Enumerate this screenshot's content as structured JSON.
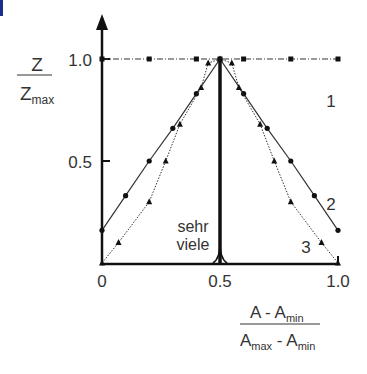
{
  "chart_data": {
    "type": "line",
    "title": "",
    "ylabel": {
      "numerator": "Z",
      "denominator": "Z",
      "denominator_sub": "max"
    },
    "xlabel": {
      "numerator": "A - A",
      "numerator_sub": "min",
      "denominator_a": "A",
      "denominator_a_sub": "max",
      "denominator_b": " - A",
      "denominator_b_sub": "min"
    },
    "xlim": [
      0,
      1.0
    ],
    "ylim": [
      0,
      1.0
    ],
    "x_ticks": [
      "0",
      "0.5",
      "1.0"
    ],
    "y_ticks": [
      "0.5",
      "1.0"
    ],
    "grid": false,
    "annotation": {
      "line1": "sehr",
      "line2": "viele"
    },
    "series": [
      {
        "name": "1",
        "style": "dash-dot, square markers",
        "x": [
          0,
          0.2,
          0.4,
          0.5,
          0.6,
          0.8,
          1.0
        ],
        "y": [
          1.0,
          1.0,
          1.0,
          1.0,
          1.0,
          1.0,
          1.0
        ]
      },
      {
        "name": "2",
        "style": "solid, circle markers",
        "x": [
          0,
          0.1,
          0.2,
          0.3,
          0.4,
          0.5,
          0.6,
          0.7,
          0.8,
          0.9,
          1.0
        ],
        "y": [
          0.16,
          0.33,
          0.5,
          0.66,
          0.83,
          1.0,
          0.83,
          0.66,
          0.5,
          0.33,
          0.16
        ]
      },
      {
        "name": "3",
        "style": "dotted, triangle markers",
        "x": [
          0,
          0.07,
          0.2,
          0.27,
          0.33,
          0.42,
          0.45,
          0.5,
          0.55,
          0.58,
          0.67,
          0.73,
          0.8,
          0.93,
          1.0
        ],
        "y": [
          0.0,
          0.1,
          0.3,
          0.5,
          0.68,
          0.86,
          0.98,
          1.0,
          0.98,
          0.86,
          0.68,
          0.5,
          0.3,
          0.1,
          0.0
        ]
      },
      {
        "name": "sehr viele",
        "style": "thick spike",
        "x": [
          0.49,
          0.5,
          0.51
        ],
        "y": [
          0.0,
          1.0,
          0.0
        ]
      }
    ]
  }
}
